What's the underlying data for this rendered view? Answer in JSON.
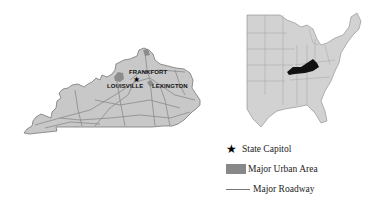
{
  "kentucky_map": {
    "cities": [
      {
        "name": "FRANKFORT",
        "role": "State Capitol"
      },
      {
        "name": "LOUISVILLE",
        "role": "Major Urban Area"
      },
      {
        "name": "LEXINGTON",
        "role": "Major Urban Area"
      }
    ],
    "fill_color": "#c8c8c8",
    "road_color": "#8a8a8a",
    "urban_color": "#8c8c8c"
  },
  "us_locator_map": {
    "highlighted_state": "Kentucky",
    "highlight_color": "#111111",
    "fill_color": "#d2d2d2"
  },
  "legend": {
    "items": [
      {
        "symbol": "star-icon",
        "label": "State Capitol"
      },
      {
        "symbol": "gray-swatch",
        "label": "Major Urban Area"
      },
      {
        "symbol": "line",
        "label": "Major Roadway"
      }
    ]
  }
}
